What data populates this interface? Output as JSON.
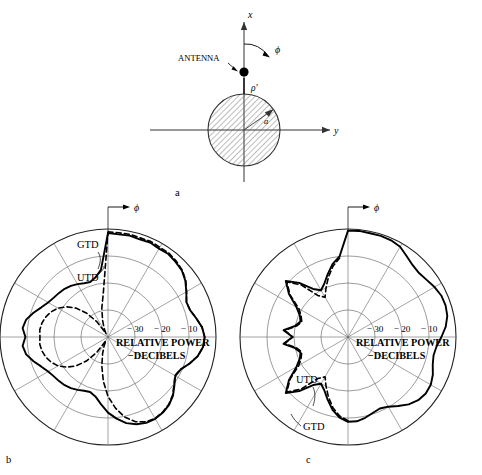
{
  "figure": {
    "panels": [
      {
        "id": "a",
        "label": "a",
        "caption_label": "a"
      },
      {
        "id": "b",
        "label": "b",
        "caption_label": "b"
      },
      {
        "id": "c",
        "label": "c",
        "caption_label": "c"
      }
    ]
  },
  "geometry": {
    "axis_x_label": "x",
    "axis_y_label": "y",
    "phi_label": "ϕ",
    "antenna_label": "ANTENNA",
    "rho_label": "ρ′",
    "radius_label": "a",
    "cylinder_fill": "hatched",
    "hatch_color": "#5a5a5a"
  },
  "chart_data": [
    {
      "type": "line",
      "panel": "b",
      "title": "",
      "coordinate_system": "polar",
      "rlabel": "RELATIVE POWER",
      "rlabel2": "−DECIBELS",
      "phi_label": "ϕ",
      "r_ticks": [
        -30,
        -20,
        -10
      ],
      "r_tick_labels": [
        "− 30",
        "− 20",
        "− 10"
      ],
      "rlim": [
        -40,
        0
      ],
      "rings": 4,
      "spoke_step_deg": 30,
      "grid": true,
      "legend": [
        {
          "name": "GTD",
          "style": "dashed"
        },
        {
          "name": "UTD",
          "style": "solid"
        }
      ],
      "series": [
        {
          "name": "UTD",
          "style": "solid",
          "angles_deg": [
            0,
            6,
            12,
            18,
            24,
            30,
            36,
            42,
            48,
            54,
            60,
            66,
            72,
            78,
            84,
            90,
            96,
            102,
            108,
            114,
            120,
            126,
            132,
            138,
            144,
            150,
            156,
            162,
            168,
            174,
            180,
            186,
            192,
            198,
            204,
            210,
            216,
            222,
            228,
            234,
            240,
            246,
            252,
            258,
            264,
            270,
            276,
            282,
            288,
            294,
            300,
            306,
            312,
            318,
            324,
            330,
            336,
            342,
            348,
            354
          ],
          "values_db": [
            -1.5,
            -1.8,
            -1.6,
            -2.0,
            -1.7,
            -2.2,
            -2.0,
            -2.6,
            -3.2,
            -4.6,
            -6.5,
            -8.2,
            -8.0,
            -6.6,
            -5.0,
            -4.2,
            -4.6,
            -6.0,
            -8.2,
            -10.5,
            -11.2,
            -9.6,
            -7.6,
            -6.2,
            -5.4,
            -5.0,
            -5.2,
            -6.0,
            -7.4,
            -9.6,
            -12.0,
            -15.0,
            -17.5,
            -18.6,
            -18.2,
            -17.4,
            -16.6,
            -16.0,
            -15.6,
            -15.2,
            -14.4,
            -13.0,
            -11.0,
            -9.0,
            -8.2,
            -9.4,
            -8.2,
            -9.0,
            -11.0,
            -13.0,
            -14.4,
            -15.2,
            -15.6,
            -16.0,
            -16.6,
            -17.4,
            -18.2,
            -18.6,
            -17.5,
            -15.0
          ]
        },
        {
          "name": "GTD",
          "style": "dashed",
          "angles_deg": [
            0,
            6,
            12,
            18,
            24,
            30,
            36,
            42,
            48,
            54,
            60,
            66,
            72,
            78,
            84,
            90,
            96,
            102,
            108,
            114,
            120,
            126,
            132,
            138,
            144,
            150,
            156,
            162,
            168,
            174,
            180,
            186,
            192,
            198,
            204,
            210,
            216,
            222,
            228,
            234,
            240,
            246,
            252,
            258,
            264,
            270,
            276,
            282,
            288,
            294,
            300,
            306,
            312,
            318,
            324,
            330,
            336,
            342,
            348,
            354
          ],
          "values_db": [
            -1.0,
            -1.2,
            -1.1,
            -1.4,
            -1.2,
            -1.6,
            -1.6,
            -2.2,
            -3.0,
            -4.4,
            -6.4,
            -8.2,
            -8.0,
            -6.6,
            -5.0,
            -4.2,
            -4.6,
            -6.0,
            -8.2,
            -10.6,
            -11.4,
            -9.8,
            -7.8,
            -6.4,
            -5.6,
            -5.2,
            -5.6,
            -7.0,
            -9.6,
            -13.5,
            -18.0,
            -23.5,
            -29.0,
            -33.5,
            -36.5,
            -38.5,
            -33.0,
            -28.0,
            -24.0,
            -21.0,
            -18.6,
            -17.0,
            -15.8,
            -15.0,
            -14.6,
            -14.8,
            -14.6,
            -15.0,
            -15.8,
            -17.0,
            -18.6,
            -21.0,
            -24.0,
            -28.0,
            -33.0,
            -38.5,
            -36.5,
            -33.5,
            -29.0,
            -23.5
          ]
        }
      ]
    },
    {
      "type": "line",
      "panel": "c",
      "title": "",
      "coordinate_system": "polar",
      "rlabel": "RELATIVE POWER",
      "rlabel2": "−DECIBELS",
      "phi_label": "ϕ",
      "r_ticks": [
        -30,
        -20,
        -10
      ],
      "r_tick_labels": [
        "− 30",
        "− 20",
        "− 10"
      ],
      "rlim": [
        -40,
        0
      ],
      "rings": 4,
      "spoke_step_deg": 30,
      "grid": true,
      "legend": [
        {
          "name": "UTD",
          "style": "solid"
        },
        {
          "name": "GTD",
          "style": "dashed"
        }
      ],
      "series": [
        {
          "name": "UTD",
          "style": "solid",
          "angles_deg": [
            0,
            6,
            12,
            18,
            24,
            30,
            36,
            42,
            48,
            54,
            60,
            66,
            72,
            78,
            84,
            90,
            96,
            102,
            108,
            114,
            120,
            126,
            132,
            138,
            144,
            150,
            156,
            162,
            168,
            174,
            180,
            186,
            192,
            198,
            204,
            210,
            216,
            222,
            228,
            234,
            240,
            246,
            252,
            258,
            264,
            270,
            276,
            282,
            288,
            294,
            300,
            306,
            312,
            318,
            324,
            330,
            336,
            342,
            348,
            354
          ],
          "values_db": [
            -0.6,
            -0.5,
            -0.7,
            -0.6,
            -0.8,
            -1.4,
            -3.0,
            -4.2,
            -4.6,
            -4.0,
            -3.0,
            -2.2,
            -2.0,
            -2.4,
            -3.6,
            -5.4,
            -7.0,
            -7.6,
            -7.0,
            -5.6,
            -4.6,
            -4.4,
            -5.0,
            -6.4,
            -8.4,
            -10.2,
            -11.0,
            -10.4,
            -9.4,
            -8.6,
            -8.6,
            -10.0,
            -12.4,
            -15.6,
            -18.4,
            -20.0,
            -18.0,
            -13.0,
            -9.0,
            -13.0,
            -18.0,
            -20.5,
            -21.5,
            -20.0,
            -16.0,
            -19.5,
            -16.0,
            -20.0,
            -21.5,
            -20.5,
            -18.0,
            -13.0,
            -9.0,
            -13.0,
            -18.0,
            -20.0,
            -18.4,
            -15.6,
            -12.4,
            -10.0
          ]
        },
        {
          "name": "GTD",
          "style": "dashed",
          "angles_deg": [
            180,
            186,
            192,
            198,
            204,
            210,
            216,
            222,
            228,
            234,
            240,
            246,
            252,
            258,
            264,
            270,
            276,
            282,
            288,
            294,
            300,
            306,
            312,
            318,
            324,
            330,
            336,
            342,
            348,
            354
          ],
          "values_db": [
            -9.0,
            -10.6,
            -13.2,
            -16.6,
            -20.0,
            -23.0,
            -21.0,
            -14.0,
            -9.5,
            -13.5,
            -19.0,
            -21.0,
            -22.0,
            -20.5,
            -16.5,
            -19.5,
            -16.5,
            -20.5,
            -22.0,
            -21.0,
            -19.0,
            -13.5,
            -9.5,
            -14.0,
            -21.0,
            -23.0,
            -20.0,
            -16.6,
            -13.2,
            -10.6
          ]
        }
      ]
    }
  ]
}
